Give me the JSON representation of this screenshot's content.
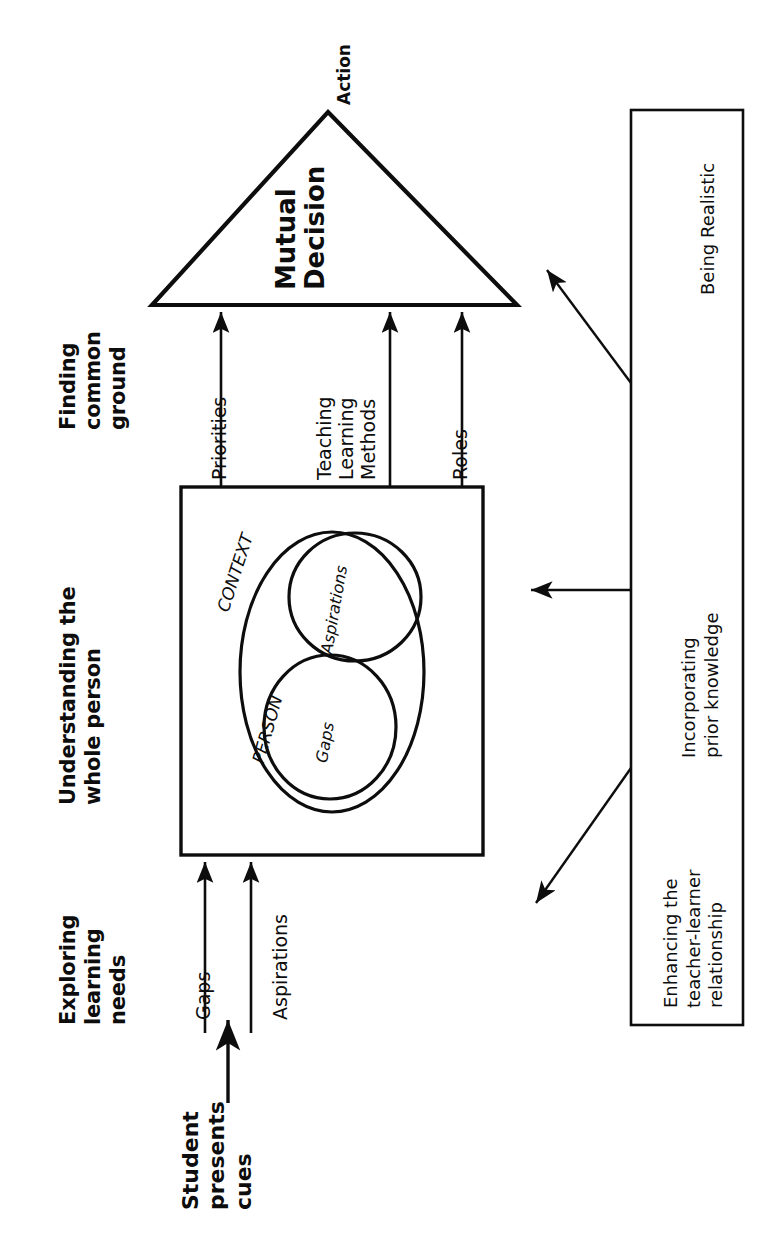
{
  "diagram": {
    "orientation": "rotated-90-ccw",
    "stage": {
      "width": 783,
      "height": 1235,
      "background": "#ffffff",
      "ink": "#0d0d0d"
    },
    "stage_headers": [
      {
        "id": "finding-common-ground",
        "label": "Finding\ncommon\nground"
      },
      {
        "id": "understanding-whole-person",
        "label": "Understanding the\nwhole person"
      },
      {
        "id": "exploring-learning-needs",
        "label": "Exploring\nlearning\nneeds"
      }
    ],
    "triangle": {
      "apex_label": "Action",
      "body_label": "Mutual\nDecision"
    },
    "flow_to_decision": [
      {
        "id": "priorities",
        "label": "Priorities"
      },
      {
        "id": "teaching-learning-methods",
        "label": "Teaching\nLearning\nMethods"
      },
      {
        "id": "roles",
        "label": "Roles"
      }
    ],
    "context_box": {
      "outer_label": "CONTEXT",
      "person_label": "PERSON",
      "circles": [
        {
          "id": "aspirations-circle",
          "label": "Aspirations"
        },
        {
          "id": "gaps-circle",
          "label": "Gaps"
        }
      ]
    },
    "inputs": [
      {
        "id": "gaps-input",
        "label": "Gaps"
      },
      {
        "id": "aspirations-input",
        "label": "Aspirations"
      }
    ],
    "entry_point": {
      "id": "student-presents-cues",
      "label": "Student\npresents\ncues"
    },
    "side_box": {
      "items": [
        {
          "id": "being-realistic",
          "label": "Being Realistic"
        },
        {
          "id": "incorporating-prior-knowledge",
          "label": "Incorporating\nprior knowledge"
        },
        {
          "id": "enhancing-teacher-learner-relationship",
          "label": "Enhancing the\nteacher-learner\nrelationship"
        }
      ]
    }
  }
}
